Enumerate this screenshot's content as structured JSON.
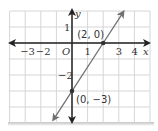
{
  "chart_data": {
    "type": "line",
    "title": "",
    "xlabel": "x",
    "ylabel": "y",
    "origin_label": "O",
    "xlim": [
      -4,
      5
    ],
    "ylim": [
      -5,
      2
    ],
    "grid": true,
    "x_tick_labels": [
      {
        "value": -3,
        "label": "−3"
      },
      {
        "value": -2,
        "label": "−2"
      },
      {
        "value": 1,
        "label": "1"
      },
      {
        "value": 3,
        "label": "3"
      },
      {
        "value": 4,
        "label": "4"
      }
    ],
    "y_tick_labels": [
      {
        "value": 1,
        "label": "1"
      },
      {
        "value": -2,
        "label": "−2"
      }
    ],
    "series": [
      {
        "name": "line",
        "equation": "y = 1.5x - 3",
        "slope": 1.5,
        "intercept": -3
      }
    ],
    "points": [
      {
        "x": 2,
        "y": 0,
        "label": "(2, 0)"
      },
      {
        "x": 0,
        "y": -3,
        "label": "(0, −3)"
      }
    ],
    "colors": {
      "grid": "#d6d6d6",
      "axis": "#222222",
      "line": "#707070",
      "point": "#333333"
    }
  }
}
